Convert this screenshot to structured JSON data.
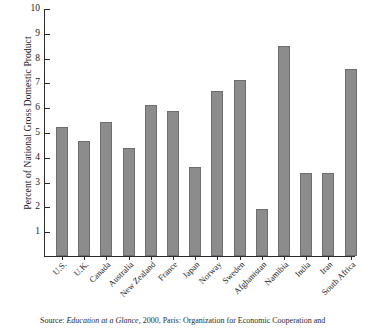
{
  "chart_data": {
    "type": "bar",
    "title": "",
    "xlabel": "",
    "ylabel": "Percent of National Gross Domestic Product",
    "ylim": [
      0,
      10
    ],
    "yticks": [
      1,
      2,
      3,
      4,
      5,
      6,
      7,
      8,
      9,
      10
    ],
    "grid": false,
    "legend": "none",
    "bar_color": "#8c8c8c",
    "bar_edge_color": "#6e6e6e",
    "axis_color": "#2b2b2b",
    "background": "#ffffff",
    "categories": [
      "U.S.",
      "U.K.",
      "Canada",
      "Australia",
      "New Zealand",
      "France",
      "Japan",
      "Norway",
      "Sweden",
      "Afghanistan",
      "Namibia",
      "India",
      "Iran",
      "South Africa"
    ],
    "values": [
      5.2,
      4.65,
      5.4,
      4.35,
      6.1,
      5.85,
      3.6,
      6.65,
      7.1,
      1.9,
      8.45,
      3.35,
      3.35,
      7.55
    ]
  },
  "source": {
    "prefix": "Source: ",
    "italic_title": "Education at a Glance,",
    "rest": " 2000, Paris: Organization for Economic Cooperation and"
  }
}
